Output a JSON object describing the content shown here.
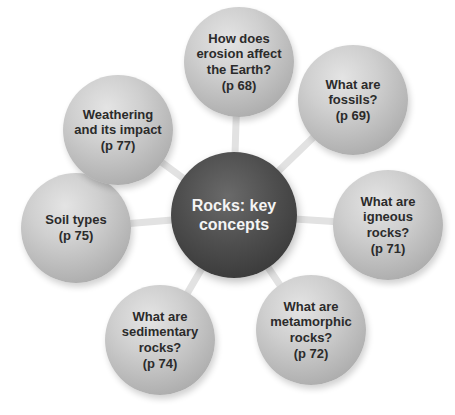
{
  "diagram": {
    "type": "mind-map",
    "center": {
      "label": "Rocks: key\nconcepts",
      "color": "#444444"
    },
    "nodes": [
      {
        "label": "How does\nerosion affect\nthe Earth?\n(p 68)",
        "page": "p 68"
      },
      {
        "label": "What are\nfossils?\n(p 69)",
        "page": "p 69"
      },
      {
        "label": "What are\nigneous\nrocks?\n(p 71)",
        "page": "p 71"
      },
      {
        "label": "What are\nmetamorphic\nrocks?\n(p 72)",
        "page": "p 72"
      },
      {
        "label": "What are\nsedimentary\nrocks?\n(p 74)",
        "page": "p 74"
      },
      {
        "label": "Soil types\n(p 75)",
        "page": "p 75"
      },
      {
        "label": "Weathering\nand its impact\n(p 77)",
        "page": "p 77"
      }
    ],
    "colors": {
      "outer_node": "#c4c4c4",
      "center_node": "#444444",
      "connector": "#e2e2e2",
      "background": "#ffffff"
    }
  }
}
